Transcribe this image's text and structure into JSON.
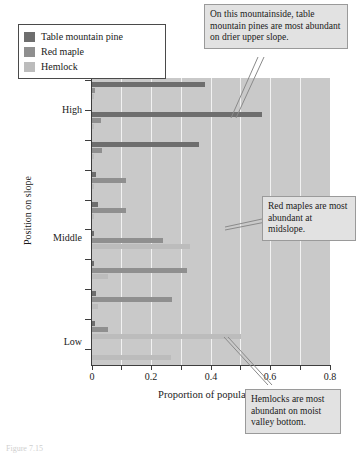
{
  "legend": {
    "items": [
      {
        "label": "Table mountain pine",
        "color": "#6e6e6e",
        "key": "pine"
      },
      {
        "label": "Red maple",
        "color": "#8f8f8f",
        "key": "maple"
      },
      {
        "label": "Hemlock",
        "color": "#bcbcbc",
        "key": "hemlock"
      }
    ]
  },
  "annotations": [
    {
      "name": "pine-callout",
      "text": "On this mountainside, table mountain pines are most abundant on drier upper slope."
    },
    {
      "name": "maple-callout",
      "text": "Red maples are most abundant at midslope."
    },
    {
      "name": "hemlock-callout",
      "text": "Hemlocks are most abundant on moist valley bottom."
    }
  ],
  "caption": "Figure 7.15",
  "chart_data": {
    "type": "bar",
    "orientation": "horizontal",
    "title": "",
    "xlabel": "Proportion of population",
    "ylabel": "Position on slope",
    "xlim": [
      0,
      0.8
    ],
    "xticks": [
      0,
      0.2,
      0.4,
      0.6,
      0.8
    ],
    "xticklabels": [
      "0",
      "0.2",
      "0.4",
      "0.6",
      "0.8"
    ],
    "yticklabels": [
      "High",
      "Middle",
      "Low"
    ],
    "ytick_positions": [
      1,
      5,
      9
    ],
    "grid": "vertical-only",
    "legend_position": "upper-left-outside",
    "categories": [
      "pos-1-highest",
      "pos-2",
      "pos-3",
      "pos-4",
      "pos-5-middle",
      "pos-6",
      "pos-7",
      "pos-8",
      "pos-9-lowest"
    ],
    "series": [
      {
        "name": "Table mountain pine",
        "color": "#6e6e6e",
        "values": [
          0.38,
          0.57,
          0.36,
          0.015,
          0.02,
          0.005,
          0.005,
          0.015,
          0.01
        ]
      },
      {
        "name": "Red maple",
        "color": "#8f8f8f",
        "values": [
          0.01,
          0.03,
          0.035,
          0.115,
          0.115,
          0.24,
          0.32,
          0.27,
          0.055
        ]
      },
      {
        "name": "Hemlock",
        "color": "#bcbcbc",
        "values": [
          0.005,
          0.005,
          0.005,
          0.005,
          0.005,
          0.33,
          0.055,
          0.02,
          0.5
        ]
      }
    ],
    "bottom_bar": {
      "name": "Hemlock",
      "value": 0.265
    }
  }
}
